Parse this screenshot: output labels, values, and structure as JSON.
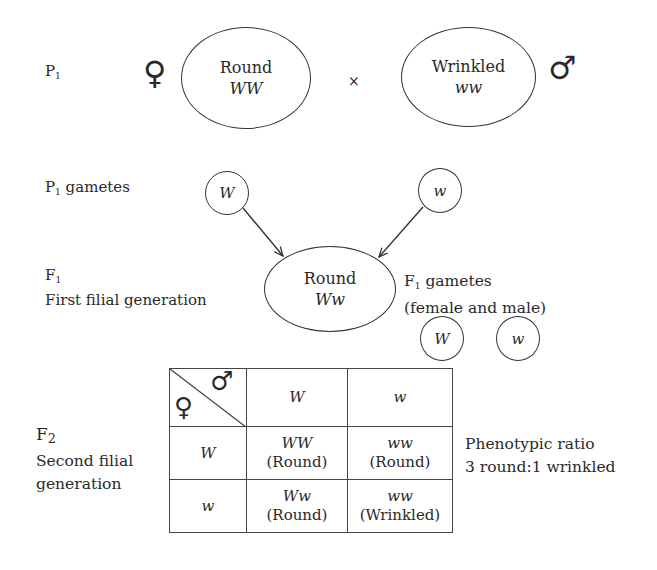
{
  "p1": {
    "label": "P",
    "label_sub": "1",
    "female_symbol": "♀",
    "male_symbol": "♂",
    "cross_symbol": "×",
    "female_parent": {
      "phenotype": "Round",
      "genotype": "WW"
    },
    "male_parent": {
      "phenotype": "Wrinkled",
      "genotype": "ww"
    }
  },
  "p1_gametes": {
    "label_prefix": "P",
    "label_sub": "1",
    "label_text": "gametes",
    "female_gamete": "W",
    "male_gamete": "w"
  },
  "f1": {
    "label": "F",
    "label_sub": "1",
    "description": "First filial generation",
    "offspring": {
      "phenotype": "Round",
      "genotype": "Ww"
    },
    "gametes_label_prefix": "F",
    "gametes_label_sub": "1",
    "gametes_label_text": "gametes",
    "gametes_note": "(female and male)",
    "gametes": [
      "W",
      "w"
    ]
  },
  "f2": {
    "label": "F",
    "label_sub": "2",
    "description_line1": "Second filial",
    "description_line2": "generation",
    "punnett": {
      "corner_female": "♀",
      "corner_male": "♂",
      "column_headers": [
        "W",
        "w"
      ],
      "rows": [
        {
          "header": "W",
          "cells": [
            {
              "genotype": "WW",
              "phenotype": "(Round)"
            },
            {
              "genotype": "ww",
              "phenotype": "(Round)"
            }
          ]
        },
        {
          "header": "w",
          "cells": [
            {
              "genotype": "Ww",
              "phenotype": "(Round)"
            },
            {
              "genotype": "ww",
              "phenotype": "(Wrinkled)"
            }
          ]
        }
      ]
    },
    "ratio_title": "Phenotypic ratio",
    "ratio_value": "3 round:1 wrinkled"
  }
}
